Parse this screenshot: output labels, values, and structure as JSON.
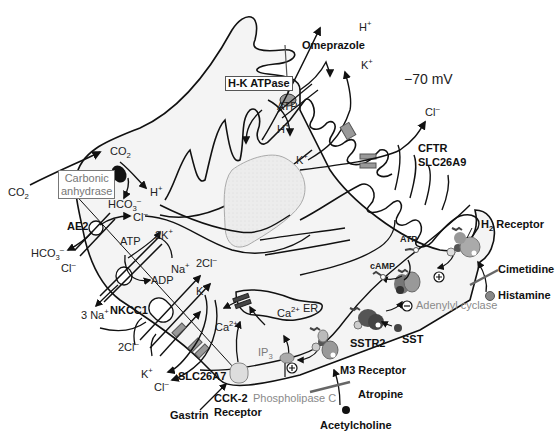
{
  "diagram": {
    "membrane_potential": "−70 mV",
    "colors": {
      "membrane": "#111111",
      "cytoplasm": "#f4f4f4",
      "nucleus": "#ebebeb",
      "channel": "#9a9a9a",
      "receptor_light": "#c8c8c8",
      "receptor_dark": "#555555",
      "text_gray": "#7a7a7a"
    },
    "apical": {
      "pump_label": "H-K ATPase",
      "inhibitor": "Omeprazole",
      "atp": "ATP",
      "h_out": "H",
      "h_in": "H",
      "k_out": "K",
      "k_in": "K",
      "plus": "+",
      "cl_out": "Cl",
      "minus": "–",
      "cftr": "CFTR",
      "slc26a9": "SLC26A9"
    },
    "carbonic": {
      "co2_out": "CO",
      "co2_in": "CO",
      "sub2": "2",
      "enzyme_line1": "Carbonic",
      "enzyme_line2": "anhydrase",
      "h": "H",
      "hco3": "HCO",
      "sub3": "3"
    },
    "basolateral": {
      "ae2": "AE2",
      "cl_in": "Cl",
      "hco3_out": "HCO",
      "cl_out": "Cl",
      "atp": "ATP",
      "adp": "ADP",
      "two_k": "2K",
      "na": "Na",
      "three_na": "3 Na",
      "nkcc1": "NKCC1",
      "two_cl_in": "2Cl",
      "k_in": "K",
      "two_cl_out": "2Cl",
      "k_out": "K",
      "cl_exit": "Cl",
      "slc26a7": "SLC26A7",
      "ca": "Ca",
      "ca_sup": "2+",
      "er": "ER",
      "er_ca": "Ca",
      "ip3": "IP",
      "ip3_sub": "3",
      "cck2_line1": "CCK-2",
      "cck2_line2": "Receptor",
      "gastrin": "Gastrin",
      "plc": "Phospholipase C",
      "m3": "M3 Receptor",
      "atropine": "Atropine",
      "acetylcholine": "Acetylcholine",
      "sstr2": "SSTR2",
      "sst": "SST",
      "adenylyl": "Adenylyl cyclase",
      "camp": "cAMP",
      "atp2": "ATP",
      "h2_h": "H",
      "h2_sub": "2",
      "h2_rest": " Receptor",
      "cimetidine": "Cimetidine",
      "histamine": "Histamine"
    },
    "icons": [
      "plus-circle-icon",
      "minus-circle-icon",
      "blocker-bar-icon",
      "ligand-dot-icon"
    ]
  }
}
